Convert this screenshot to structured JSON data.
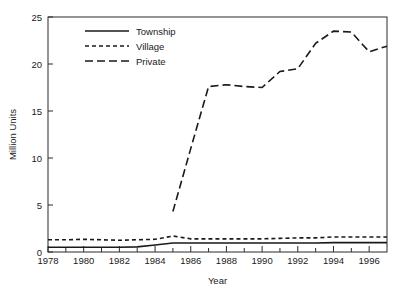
{
  "chart_data": {
    "type": "line",
    "title": "",
    "xlabel": "Year",
    "ylabel": "Million Units",
    "xlim": [
      1978,
      1997
    ],
    "ylim": [
      0,
      25
    ],
    "grid": false,
    "legend_position": "top-left-inside",
    "x_ticks": [
      1978,
      1980,
      1982,
      1984,
      1986,
      1988,
      1990,
      1992,
      1994,
      1996
    ],
    "x_tick_labels": [
      "1978",
      "1980",
      "1982",
      "1984",
      "1986",
      "1988",
      "1990",
      "1992",
      "1994",
      "1996"
    ],
    "x_minor_ticks": [
      1979,
      1981,
      1983,
      1985,
      1987,
      1989,
      1991,
      1993,
      1995
    ],
    "y_ticks": [
      0,
      5,
      10,
      15,
      20,
      25
    ],
    "y_tick_labels": [
      "0",
      "5",
      "10",
      "15",
      "20",
      "25"
    ],
    "x": [
      1978,
      1979,
      1980,
      1981,
      1982,
      1983,
      1984,
      1985,
      1986,
      1987,
      1988,
      1989,
      1990,
      1991,
      1992,
      1993,
      1994,
      1995,
      1996
    ],
    "series": [
      {
        "name": "Township",
        "dash": "solid",
        "color": "#1a1a1a",
        "x": [
          1978,
          1979,
          1980,
          1981,
          1982,
          1983,
          1984,
          1985,
          1986,
          1987,
          1988,
          1989,
          1990,
          1991,
          1992,
          1993,
          1994,
          1995,
          1996,
          1997
        ],
        "values": [
          0.5,
          0.5,
          0.5,
          0.5,
          0.5,
          0.55,
          0.75,
          0.95,
          0.95,
          0.95,
          0.95,
          0.95,
          0.95,
          0.95,
          0.95,
          0.95,
          1.0,
          1.0,
          1.0,
          1.0
        ]
      },
      {
        "name": "Village",
        "dash": "short",
        "color": "#1a1a1a",
        "x": [
          1978,
          1979,
          1980,
          1981,
          1982,
          1983,
          1984,
          1985,
          1986,
          1987,
          1988,
          1989,
          1990,
          1991,
          1992,
          1993,
          1994,
          1995,
          1996,
          1997
        ],
        "values": [
          1.3,
          1.3,
          1.35,
          1.3,
          1.25,
          1.3,
          1.35,
          1.7,
          1.4,
          1.4,
          1.4,
          1.4,
          1.4,
          1.45,
          1.5,
          1.5,
          1.6,
          1.6,
          1.6,
          1.6
        ]
      },
      {
        "name": "Private",
        "dash": "long",
        "color": "#1a1a1a",
        "x": [
          1985,
          1986,
          1987,
          1988,
          1989,
          1990,
          1991,
          1992,
          1993,
          1994,
          1995,
          1996,
          1997
        ],
        "values": [
          4.3,
          11.0,
          17.6,
          17.8,
          17.6,
          17.5,
          19.2,
          19.5,
          22.2,
          23.5,
          23.4,
          21.3,
          21.9
        ]
      }
    ]
  },
  "legend": {
    "entries": [
      {
        "label": "Township",
        "dash": "solid"
      },
      {
        "label": "Village",
        "dash": "short"
      },
      {
        "label": "Private",
        "dash": "long"
      }
    ]
  }
}
